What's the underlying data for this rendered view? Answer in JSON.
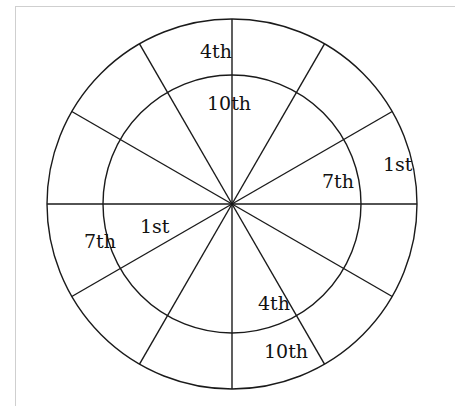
{
  "diagram": {
    "type": "house-wheel",
    "center": {
      "x": 232,
      "y": 204
    },
    "outer_radius": 185,
    "inner_radius": 129,
    "spokes": 12,
    "stroke_color": "#1a1a1a",
    "labels": [
      {
        "text": "4th",
        "x": 200,
        "y": 58
      },
      {
        "text": "10th",
        "x": 207,
        "y": 110
      },
      {
        "text": "1st",
        "x": 383,
        "y": 171
      },
      {
        "text": "7th",
        "x": 322,
        "y": 188
      },
      {
        "text": "1st",
        "x": 140,
        "y": 233
      },
      {
        "text": "7th",
        "x": 84,
        "y": 248
      },
      {
        "text": "4th",
        "x": 258,
        "y": 310
      },
      {
        "text": "10th",
        "x": 264,
        "y": 358
      }
    ]
  }
}
